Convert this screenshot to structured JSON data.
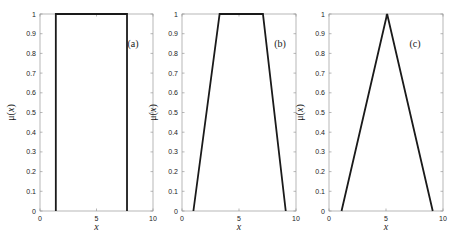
{
  "chart_data": [
    {
      "type": "line",
      "title": "",
      "panel_label": "(a)",
      "xlabel": "x",
      "ylabel": "μ(x)",
      "xlim": [
        0,
        10
      ],
      "ylim": [
        0,
        1
      ],
      "xticks": [
        0,
        5,
        10
      ],
      "yticks": [
        0,
        0.1,
        0.2,
        0.3,
        0.4,
        0.5,
        0.6,
        0.7,
        0.8,
        0.9,
        1
      ],
      "grid": false,
      "description": "Rectangular (crisp) membership function",
      "series": [
        {
          "name": "membership",
          "x": [
            1.4,
            1.4,
            7.7,
            7.7
          ],
          "y": [
            0,
            1,
            1,
            0
          ]
        }
      ]
    },
    {
      "type": "line",
      "title": "",
      "panel_label": "(b)",
      "xlabel": "x",
      "ylabel": "μ(x)",
      "xlim": [
        0,
        10
      ],
      "ylim": [
        0,
        1
      ],
      "xticks": [
        0,
        5,
        10
      ],
      "yticks": [
        0,
        0.1,
        0.2,
        0.3,
        0.4,
        0.5,
        0.6,
        0.7,
        0.8,
        0.9,
        1
      ],
      "grid": false,
      "description": "Trapezoidal membership function",
      "series": [
        {
          "name": "membership",
          "x": [
            1,
            3.3,
            7.1,
            9.1
          ],
          "y": [
            0,
            1,
            1,
            0
          ]
        }
      ]
    },
    {
      "type": "line",
      "title": "",
      "panel_label": "(c)",
      "xlabel": "x",
      "ylabel": "μ(x)",
      "xlim": [
        0,
        10
      ],
      "ylim": [
        0,
        1
      ],
      "xticks": [
        0,
        5,
        10
      ],
      "yticks": [
        0,
        0.1,
        0.2,
        0.3,
        0.4,
        0.5,
        0.6,
        0.7,
        0.8,
        0.9,
        1
      ],
      "grid": false,
      "description": "Triangular membership function",
      "series": [
        {
          "name": "membership",
          "x": [
            1.1,
            5.1,
            9.1
          ],
          "y": [
            0,
            1,
            0
          ]
        }
      ]
    }
  ],
  "panels": [
    {
      "label": "(a)",
      "ylabel": "μ(x)",
      "xlabel": "x"
    },
    {
      "label": "(b)",
      "ylabel": "μ(x)",
      "xlabel": "x"
    },
    {
      "label": "(c)",
      "ylabel": "μ(x)",
      "xlabel": "x"
    }
  ],
  "style": {
    "line_color": "#1a1a1a",
    "axis_color": "#999999"
  }
}
